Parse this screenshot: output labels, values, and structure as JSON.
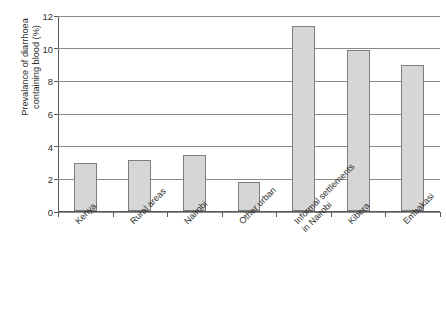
{
  "figure": {
    "title_remnant": "· · ·",
    "background_color": "#ffffff",
    "bar_fill_color": "#d6d6d6",
    "bar_border_color": "#7d7d7d",
    "axis_color": "#5a5a5a",
    "gridline_color": "#8b8b8b",
    "text_color": "#2e2e2e"
  },
  "chart_data": {
    "type": "bar",
    "title": "",
    "xlabel": "",
    "ylabel": "Prevalance of diarrhoea\ncontaining blood (%)",
    "ylim": [
      0,
      12
    ],
    "ytick_values": [
      0,
      2,
      4,
      6,
      8,
      10,
      12
    ],
    "ytick_labels": [
      "0",
      "2",
      "4",
      "6",
      "8",
      "10",
      "12"
    ],
    "grid": true,
    "grid_axis": "y",
    "legend": false,
    "xtick_rotation": -45,
    "categories": [
      "Kenya",
      "Rural areas",
      "Nairobi",
      "Other urban",
      "Informal settlements\nin Nairobi",
      "Kibera",
      "Embakasi"
    ],
    "values": [
      2.95,
      3.1,
      3.45,
      1.78,
      11.35,
      9.85,
      8.95
    ]
  }
}
